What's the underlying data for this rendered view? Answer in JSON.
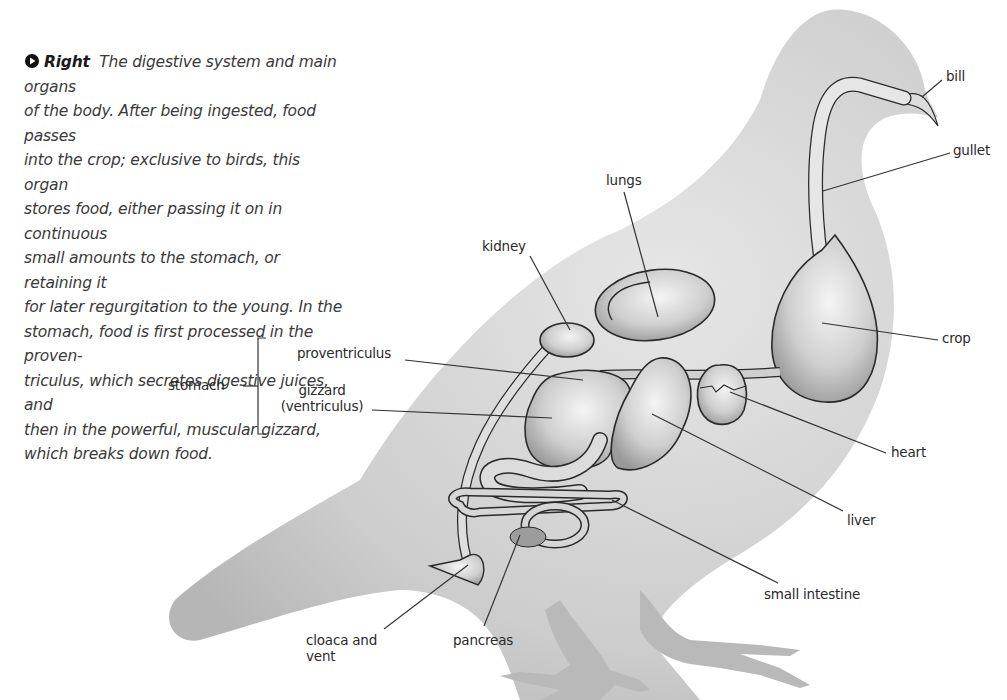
{
  "caption": {
    "lead": "Right",
    "text": "The digestive system and main organs of the body. After being ingested, food passes into the crop; exclusive to birds, this organ stores food, either passing it on in continuous small amounts to the stomach, or retaining it for later regurgitation to the young. In the stomach, food is first processed in the proven-triculus, which secretes digestive juices, and then in the powerful, muscular gizzard, which breaks down food.",
    "lines": [
      "The digestive system and main organs",
      "of the body. After being ingested, food passes",
      "into the crop; exclusive to birds, this organ",
      "stores food, either passing it on in continuous",
      "small amounts to the stomach, or retaining it",
      "for later regurgitation to the young. In the",
      "stomach, food is first processed in the proven-",
      "triculus, which secretes digestive juices, and",
      "then in the powerful, muscular gizzard,",
      "which breaks down food."
    ],
    "icon": "play-arrow-icon"
  },
  "labels": {
    "bill": "bill",
    "gullet": "gullet",
    "lungs": "lungs",
    "kidney": "kidney",
    "crop": "crop",
    "stomach": "stomach",
    "proventriculus": "proventriculus",
    "gizzard_1": "gizzard",
    "gizzard_2": "(ventriculus)",
    "heart": "heart",
    "liver": "liver",
    "small_intestine": "small intestine",
    "cloaca_1": "cloaca and",
    "cloaca_2": "vent",
    "pancreas": "pancreas"
  },
  "colors": {
    "body": "#cfcfcf",
    "organ": "#d8d8d8",
    "outline": "#2a2a2a",
    "text": "#2a2a2a",
    "leader": "#333333"
  }
}
